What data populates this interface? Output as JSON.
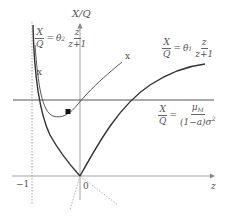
{
  "figure": {
    "y_axis_label": "X/Q",
    "x_axis_label": "z",
    "origin_label": "0",
    "neg_one_label": "−1",
    "curve_label_x_left": "x",
    "curve_label_x_right": "x",
    "eq_left": {
      "lhs_num": "X",
      "lhs_den": "Q",
      "equals": "=",
      "coef": "θ",
      "coef_sub": "2",
      "rhs_num": "z",
      "rhs_den": "z+1"
    },
    "eq_right": {
      "lhs_num": "X",
      "lhs_den": "Q",
      "equals": "=",
      "coef": "θ",
      "coef_sub": "1",
      "rhs_num": "z",
      "rhs_den": "z+1"
    },
    "eq_horizontal": {
      "lhs_num": "X",
      "lhs_den": "Q",
      "equals": "=",
      "rhs_num_main": "μ",
      "rhs_num_sub": "M",
      "rhs_den_main": "(1−a)σ",
      "rhs_den_sub": "M",
      "rhs_den_sup": "2"
    },
    "colors": {
      "curve": "#333333",
      "axis": "#888888",
      "dotted": "#aaaaaa",
      "text": "#555555"
    }
  }
}
